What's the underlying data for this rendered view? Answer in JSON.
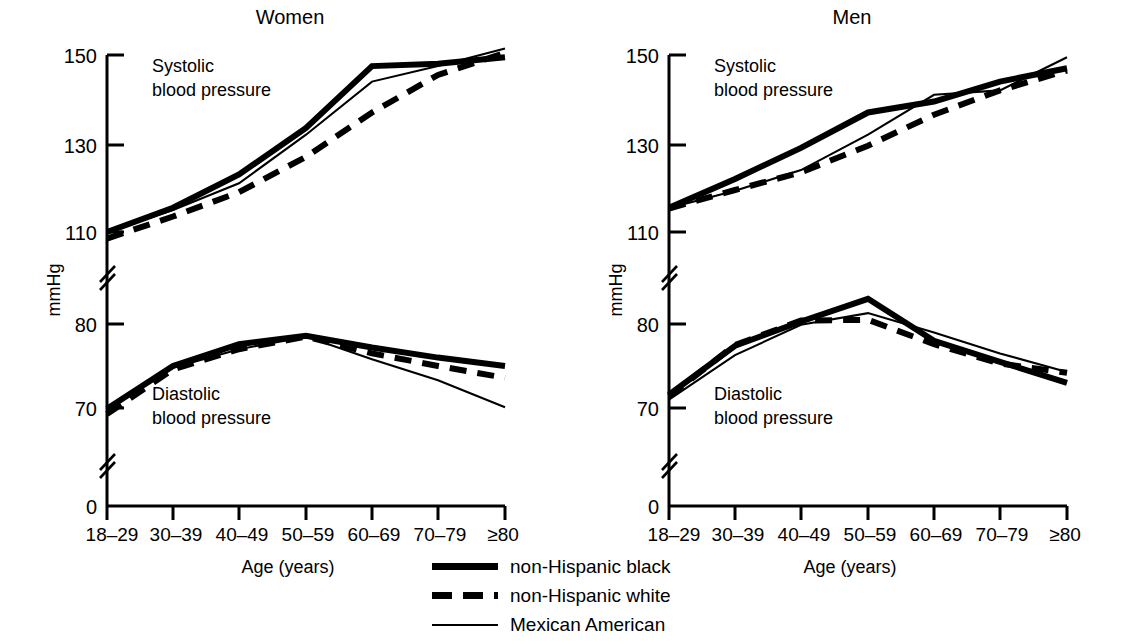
{
  "figure": {
    "y_axis_title": "mmHg",
    "x_axis_title": "Age (years)",
    "y_tick_labels": [
      "150",
      "130",
      "110",
      "80",
      "70",
      "0"
    ],
    "x_tick_labels": [
      "18–29",
      "30–39",
      "40–49",
      "50–59",
      "60–69",
      "70–79",
      "≥80"
    ],
    "systolic_note_line1": "Systolic",
    "systolic_note_line2": "blood pressure",
    "diastolic_note_line1": "Diastolic",
    "diastolic_note_line2": "blood pressure",
    "panel_women_title": "Women",
    "panel_men_title": "Men"
  },
  "legend": {
    "position": "bottom-center",
    "entries": [
      {
        "label": "non-Hispanic black",
        "style": "solid-thick",
        "swatch": "legend-line-black"
      },
      {
        "label": "non-Hispanic white",
        "style": "dashed-thick",
        "swatch": "legend-line-white"
      },
      {
        "label": "Mexican American",
        "style": "solid-thin",
        "swatch": "legend-line-mexican"
      }
    ]
  },
  "colors": {
    "ink": "#000000",
    "background": "#ffffff"
  },
  "chart_data": [
    {
      "type": "line",
      "title": "Women",
      "xlabel": "Age (years)",
      "ylabel": "mmHg",
      "grid": false,
      "legend_position": "bottom-center",
      "axis_break": true,
      "ylim_upper": [
        110,
        150
      ],
      "ylim_lower": [
        70,
        80
      ],
      "y_ticks": [
        150,
        130,
        110,
        80,
        70,
        0
      ],
      "categories": [
        "18–29",
        "30–39",
        "40–49",
        "50–59",
        "60–69",
        "70–79",
        "≥80"
      ],
      "measures": [
        {
          "measure": "Systolic blood pressure",
          "series": [
            {
              "name": "non-Hispanic black",
              "values": [
                110.0,
                115.5,
                123.0,
                133.5,
                147.5,
                148.0,
                149.5
              ]
            },
            {
              "name": "non-Hispanic white",
              "values": [
                108.5,
                113.5,
                119.0,
                127.0,
                137.0,
                145.5,
                150.5
              ]
            },
            {
              "name": "Mexican American",
              "values": [
                110.0,
                115.0,
                121.0,
                132.0,
                144.0,
                147.5,
                151.5
              ]
            }
          ]
        },
        {
          "measure": "Diastolic blood pressure",
          "series": [
            {
              "name": "non-Hispanic black",
              "values": [
                69.9,
                75.0,
                77.6,
                78.6,
                77.2,
                76.0,
                75.0
              ]
            },
            {
              "name": "non-Hispanic white",
              "values": [
                69.3,
                74.6,
                77.0,
                78.5,
                76.5,
                75.0,
                73.6
              ]
            },
            {
              "name": "Mexican American",
              "values": [
                70.0,
                74.8,
                77.0,
                78.5,
                75.8,
                73.3,
                70.1
              ]
            }
          ]
        }
      ]
    },
    {
      "type": "line",
      "title": "Men",
      "xlabel": "Age (years)",
      "ylabel": "mmHg",
      "grid": false,
      "legend_position": "bottom-center",
      "axis_break": true,
      "ylim_upper": [
        110,
        150
      ],
      "ylim_lower": [
        70,
        80
      ],
      "y_ticks": [
        150,
        130,
        110,
        80,
        70,
        0
      ],
      "categories": [
        "18–29",
        "30–39",
        "40–49",
        "50–59",
        "60–69",
        "70–79",
        "≥80"
      ],
      "measures": [
        {
          "measure": "Systolic blood pressure",
          "series": [
            {
              "name": "non-Hispanic black",
              "values": [
                115.5,
                122.0,
                129.0,
                137.0,
                139.5,
                144.0,
                147.0
              ]
            },
            {
              "name": "non-Hispanic white",
              "values": [
                115.3,
                119.5,
                123.5,
                129.5,
                136.5,
                142.0,
                146.5
              ]
            },
            {
              "name": "Mexican American",
              "values": [
                115.4,
                119.3,
                124.0,
                132.0,
                141.0,
                142.0,
                149.5
              ]
            }
          ]
        },
        {
          "measure": "Diastolic blood pressure",
          "series": [
            {
              "name": "non-Hispanic black",
              "values": [
                71.6,
                77.4,
                80.3,
                83.0,
                78.0,
                75.5,
                73.0
              ]
            },
            {
              "name": "non-Hispanic white",
              "values": [
                71.4,
                77.5,
                80.4,
                80.5,
                77.6,
                75.3,
                74.2
              ]
            },
            {
              "name": "Mexican American",
              "values": [
                71.0,
                76.3,
                79.9,
                81.3,
                79.0,
                76.5,
                74.3
              ]
            }
          ]
        }
      ]
    }
  ]
}
